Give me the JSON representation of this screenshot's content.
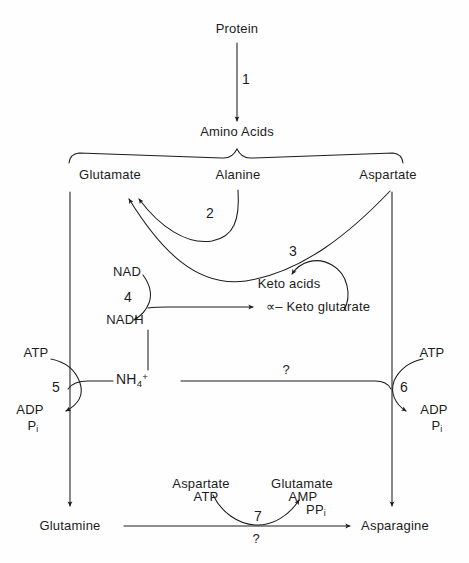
{
  "diagram": {
    "background_color": "#fefefe",
    "stroke_color": "#1c1c1c"
  },
  "nodes": {
    "protein": "Protein",
    "amino_acids": "Amino Acids",
    "glutamate": "Glutamate",
    "alanine": "Alanine",
    "aspartate": "Aspartate",
    "nad": "NAD",
    "nadh": "NADH",
    "keto_acids": "Keto acids",
    "alpha_keto_glutarate_alpha": "∝",
    "alpha_keto_glutarate_rest": "– Keto  glutarate",
    "ammonium_base": "NH",
    "ammonium_sub": "4",
    "ammonium_sup": "+",
    "atp_left": "ATP",
    "adp_left": "ADP",
    "pi_left_base": "P",
    "pi_left_sub": "i",
    "atp_right": "ATP",
    "adp_right": "ADP",
    "pi_right_base": "P",
    "pi_right_sub": "i",
    "glutamine": "Glutamine",
    "asparagine": "Asparagine",
    "cosub_aspartate": "Aspartate",
    "cosub_atp": "ATP",
    "coprod_glutamate": "Glutamate",
    "coprod_amp": "AMP",
    "coprod_ppi_base": "PP",
    "coprod_ppi_sub": "i"
  },
  "step_numbers": {
    "s1": "1",
    "s2": "2",
    "s3": "3",
    "s4": "4",
    "s5": "5",
    "s6": "6",
    "s7": "7"
  },
  "unknowns": {
    "q_nh4_transfer": "?",
    "q_glutamine_asparagine": "?"
  }
}
